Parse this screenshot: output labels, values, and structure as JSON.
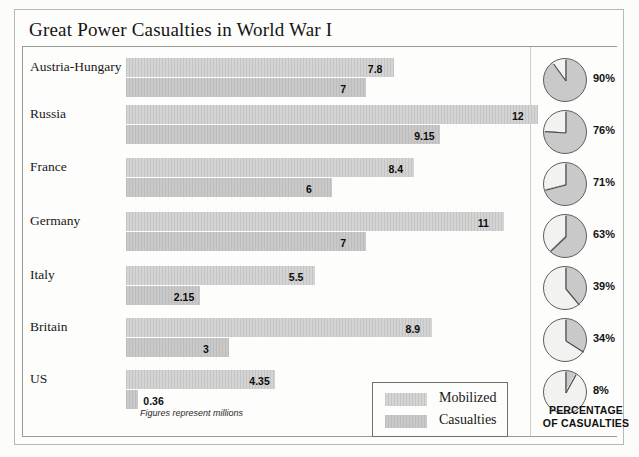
{
  "chart_data": {
    "type": "bar",
    "title": "Great Power Casualties in World War I",
    "xlabel": "",
    "ylabel": "",
    "footnote": "Figures represent millions",
    "units": "millions",
    "categories": [
      "Austria-Hungary",
      "Russia",
      "France",
      "Germany",
      "Italy",
      "Britain",
      "US"
    ],
    "series": [
      {
        "name": "Mobilized",
        "values": [
          7.8,
          12,
          8.4,
          11,
          5.5,
          8.9,
          4.35
        ]
      },
      {
        "name": "Casualties",
        "values": [
          7,
          9.15,
          6,
          7,
          2.15,
          3,
          0.36
        ]
      }
    ],
    "value_labels": {
      "mobilized": [
        "7.8",
        "12",
        "8.4",
        "11",
        "5.5",
        "8.9",
        "4.35"
      ],
      "casualties": [
        "7",
        "9.15",
        "6",
        "7",
        "2.15",
        "3",
        "0.36"
      ]
    },
    "pies": {
      "title_line1": "PERCENTAGE",
      "title_line2": "OF CASUALTIES",
      "labels": [
        "90%",
        "76%",
        "71%",
        "63%",
        "39%",
        "34%",
        "8%"
      ],
      "values": [
        90,
        76,
        71,
        63,
        39,
        34,
        8
      ]
    },
    "legend": {
      "position": "bottom-right",
      "entries": [
        {
          "key": "mobilized",
          "label": "Mobilized"
        },
        {
          "key": "casualties",
          "label": "Casualties"
        }
      ]
    },
    "axis_max": 12,
    "grid": false,
    "colors": {
      "mobilized": "#cbcbcb",
      "casualties": "#c2c2c2",
      "pie_fill": "#c9c9c9",
      "pie_stroke": "#5d5d5d",
      "rule": "#9b9b96",
      "text": "#141414",
      "background": "#fdfdfb"
    }
  },
  "page": {
    "bottom_caption": ""
  }
}
